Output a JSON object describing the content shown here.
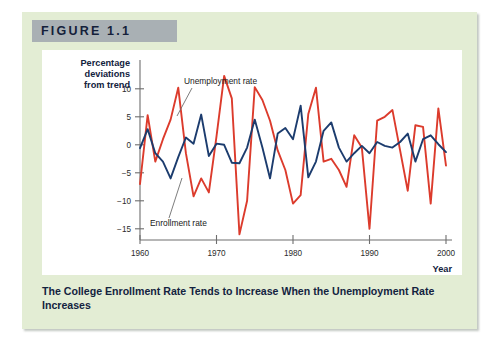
{
  "figure": {
    "banner_label": "FIGURE 1.1",
    "caption": "The College Enrollment Rate Tends to Increase When the Unemployment Rate Increases",
    "panel_color": "#e3edd4",
    "banner_color": "#a9b0b4"
  },
  "chart_data": {
    "type": "line",
    "title": "",
    "xlabel": "Year",
    "ylabel": "Percentage deviations from trend",
    "xlim": [
      1960,
      2000
    ],
    "ylim": [
      -17,
      13
    ],
    "yticks": [
      10,
      5,
      0,
      -5,
      -10,
      -15
    ],
    "ytick_labels": [
      "10",
      "5",
      "0",
      "−5",
      "−10",
      "−15"
    ],
    "xticks": [
      1960,
      1970,
      1980,
      1990,
      2000
    ],
    "xtick_labels": [
      "1960",
      "1970",
      "1980",
      "1990",
      "2000"
    ],
    "grid": false,
    "legend": "annotations",
    "annotations": [
      {
        "text": "Unemployment rate",
        "series": "Unemployment rate",
        "x": 1965.2,
        "y": 11.6
      },
      {
        "text": "Enrollment rate",
        "series": "Enrollment rate",
        "x": 1962.4,
        "y": -10.3
      }
    ],
    "x": [
      1960,
      1961,
      1962,
      1963,
      1964,
      1965,
      1966,
      1967,
      1968,
      1969,
      1970,
      1971,
      1972,
      1973,
      1974,
      1975,
      1976,
      1977,
      1978,
      1979,
      1980,
      1981,
      1982,
      1983,
      1984,
      1985,
      1986,
      1987,
      1988,
      1989,
      1990,
      1991,
      1992,
      1993,
      1994,
      1995,
      1996,
      1997,
      1998,
      1999,
      2000
    ],
    "series": [
      {
        "name": "Unemployment rate",
        "color": "#DC3B2C",
        "values": [
          -7.0,
          5.3,
          -3.0,
          1.0,
          4.5,
          10.2,
          -1.5,
          -9.2,
          -6.0,
          -8.5,
          1.5,
          12.3,
          8.3,
          -16.0,
          -10.0,
          10.3,
          8.0,
          4.3,
          -1.0,
          -4.5,
          -10.5,
          -9.0,
          5.5,
          10.2,
          -3.0,
          -2.5,
          -4.5,
          -7.5,
          1.7,
          -0.5,
          -15.0,
          4.3,
          5.0,
          6.2,
          -1.0,
          -8.2,
          3.5,
          3.2,
          -10.5,
          6.5,
          -3.7
        ]
      },
      {
        "name": "Enrollment rate",
        "color": "#1C3C6E",
        "values": [
          -0.6,
          2.8,
          -1.5,
          -3.0,
          -6.0,
          -2.2,
          1.3,
          0.2,
          5.4,
          -2.0,
          0.2,
          0.0,
          -3.2,
          -3.3,
          -0.5,
          4.5,
          -0.5,
          -6.0,
          2.0,
          3.0,
          1.0,
          7.0,
          -5.8,
          -3.0,
          2.5,
          4.0,
          -0.5,
          -3.0,
          -1.5,
          -0.2,
          -1.5,
          0.5,
          -0.2,
          -0.5,
          0.5,
          2.0,
          -3.0,
          1.0,
          1.7,
          0.1,
          -1.3
        ]
      }
    ]
  }
}
